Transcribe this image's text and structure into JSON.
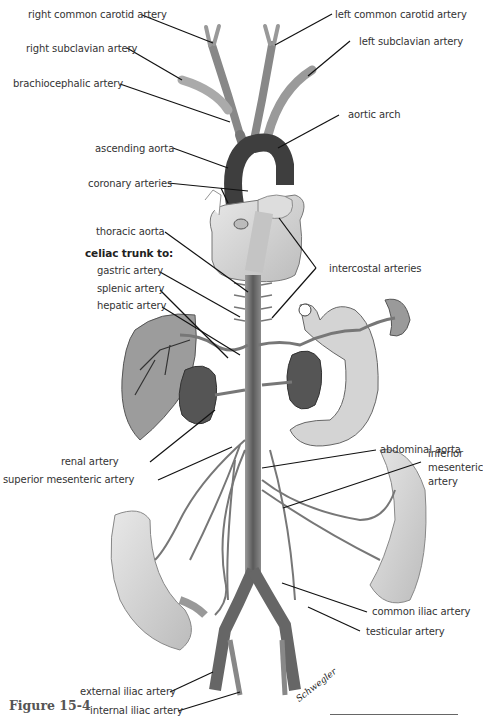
{
  "figure": {
    "caption": "Figure 15-4",
    "signature": "Schwegler",
    "labels": {
      "right_common_carotid": "right common carotid artery",
      "right_subclavian": "right subclavian artery",
      "brachiocephalic": "brachiocephalic artery",
      "left_common_carotid": "left common carotid artery",
      "left_subclavian": "left subclavian artery",
      "aortic_arch": "aortic arch",
      "ascending_aorta": "ascending aorta",
      "coronary": "coronary arteries",
      "thoracic_aorta": "thoracic aorta",
      "celiac_heading": "celiac trunk to:",
      "gastric": "gastric artery",
      "splenic": "splenic artery",
      "hepatic": "hepatic artery",
      "intercostal": "intercostal arteries",
      "abdominal_aorta": "abdominal aorta",
      "inferior_mesenteric_1": "inferior",
      "inferior_mesenteric_2": "mesenteric",
      "inferior_mesenteric_3": "artery",
      "renal": "renal artery",
      "superior_mesenteric": "superior mesenteric artery",
      "common_iliac": "common iliac artery",
      "testicular": "testicular artery",
      "external_iliac": "external iliac artery",
      "internal_iliac": "internal iliac artery"
    }
  },
  "colors": {
    "artery_dark": "#4a4a4a",
    "artery_mid": "#7a7a7a",
    "organ_fill": "#c8c8c8",
    "heart_fill": "#d8d8d8",
    "kidney_fill": "#5a5a5a",
    "leader_line": "#111111"
  }
}
